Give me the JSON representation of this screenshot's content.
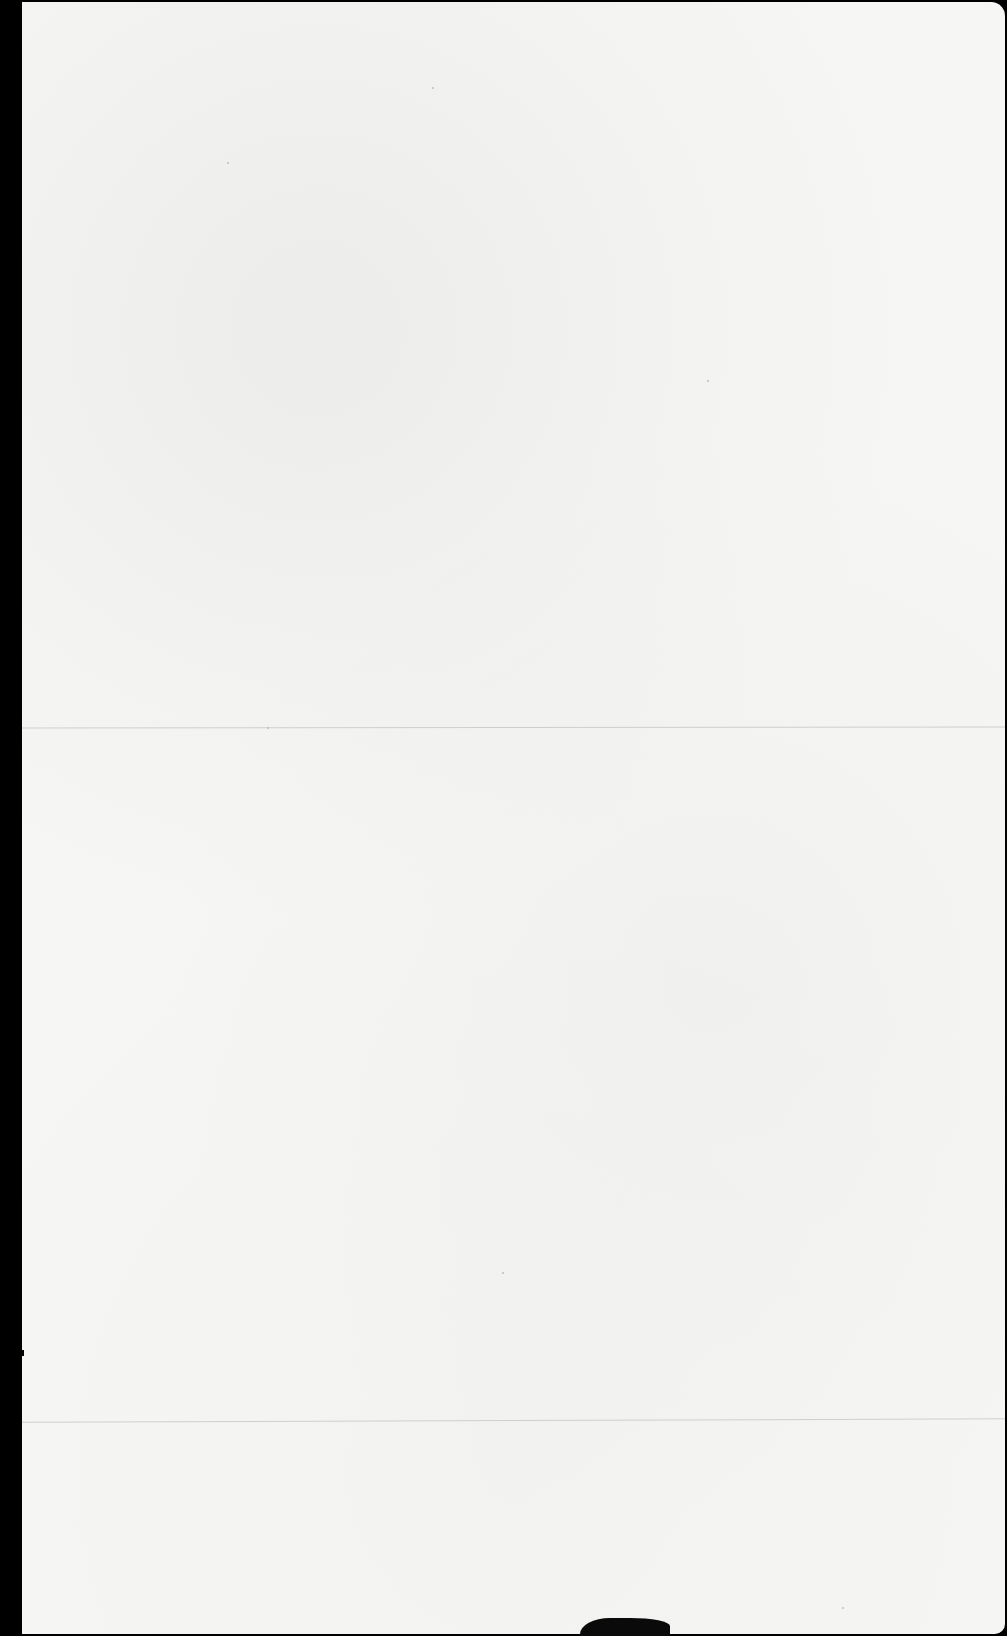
{
  "document": {
    "type": "scanned blank page",
    "text": "",
    "colors": {
      "paper": "#f6f6f5",
      "background": "#000000",
      "fold_line": "#cfcfcd"
    },
    "features": {
      "fold_lines": 2,
      "bottom_edge_mark": true
    }
  }
}
